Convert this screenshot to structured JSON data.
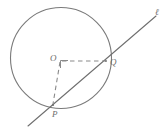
{
  "figure": {
    "kind": "circle-secant-geometry-diagram",
    "background_color": "#ffffff",
    "stroke_color": "#7a7a7a",
    "dash_color": "#8a8a8a",
    "label_color": "#6d6d6d"
  },
  "circle": {
    "name": "circle-O",
    "center_x": 61,
    "center_y": 58,
    "radius": 51
  },
  "points": [
    {
      "id": "O",
      "label": "O",
      "x": 61,
      "y": 58,
      "role": "center"
    },
    {
      "id": "Q",
      "label": "Q",
      "x": 106,
      "y": 62,
      "role": "on-circle"
    },
    {
      "id": "P",
      "label": "P",
      "x": 53,
      "y": 105,
      "role": "on-circle"
    }
  ],
  "line": {
    "label": "ℓ",
    "x1": 28,
    "y1": 126,
    "x2": 156,
    "y2": 16,
    "style": "solid"
  },
  "segments": [
    {
      "id": "OQ",
      "from": "O",
      "to": "Q",
      "style": "dashed"
    },
    {
      "id": "OP",
      "from": "O",
      "to": "P",
      "style": "dashed"
    }
  ],
  "right_angle_marker": {
    "name": "right-angle-at-O",
    "vertex_x": 61,
    "vertex_y": 58,
    "size": 7
  }
}
